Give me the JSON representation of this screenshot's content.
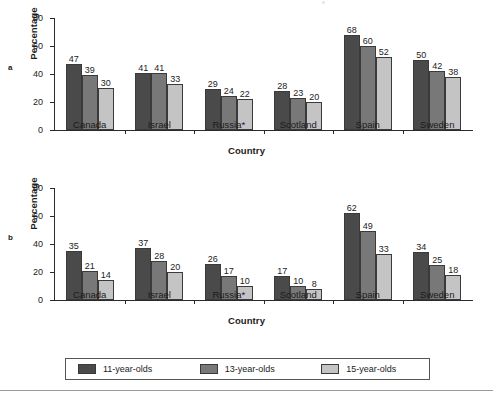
{
  "figure": {
    "bottom_rule": true
  },
  "panels": [
    {
      "tag": "a",
      "ylabel": "Percentage",
      "xlabel": "Country"
    },
    {
      "tag": "b",
      "ylabel": "Percentage",
      "xlabel": "Country"
    }
  ],
  "axis": {
    "yticks": [
      "0",
      "20",
      "40",
      "60",
      "80"
    ],
    "ymin": 0,
    "ymax": 80
  },
  "legend": {
    "items": [
      {
        "label": "11-year-olds",
        "swatch": "s0",
        "color": "#4a4a4a"
      },
      {
        "label": "13-year-olds",
        "swatch": "s1",
        "color": "#787878"
      },
      {
        "label": "15-year-olds",
        "swatch": "s2",
        "color": "#c4c4c4"
      }
    ]
  },
  "chart_data": [
    {
      "type": "bar",
      "panel": "a",
      "title": "",
      "xlabel": "Country",
      "ylabel": "Percentage",
      "ylim": [
        0,
        80
      ],
      "yticks": [
        0,
        20,
        40,
        60,
        80
      ],
      "grid": false,
      "legend_position": "bottom",
      "categories": [
        "Canada",
        "Israel",
        "Russia*",
        "Scotland",
        "Spain",
        "Sweden"
      ],
      "series": [
        {
          "name": "11-year-olds",
          "color": "#4a4a4a",
          "values": [
            47,
            41,
            29,
            28,
            68,
            50
          ]
        },
        {
          "name": "13-year-olds",
          "color": "#787878",
          "values": [
            39,
            41,
            24,
            23,
            60,
            42
          ]
        },
        {
          "name": "15-year-olds",
          "color": "#c4c4c4",
          "values": [
            30,
            33,
            22,
            20,
            52,
            38
          ]
        }
      ]
    },
    {
      "type": "bar",
      "panel": "b",
      "title": "",
      "xlabel": "Country",
      "ylabel": "Percentage",
      "ylim": [
        0,
        80
      ],
      "yticks": [
        0,
        20,
        40,
        60,
        80
      ],
      "grid": false,
      "legend_position": "bottom",
      "categories": [
        "Canada",
        "Israel",
        "Russia*",
        "Scotland",
        "Spain",
        "Sweden"
      ],
      "series": [
        {
          "name": "11-year-olds",
          "color": "#4a4a4a",
          "values": [
            35,
            37,
            26,
            17,
            62,
            34
          ]
        },
        {
          "name": "13-year-olds",
          "color": "#787878",
          "values": [
            21,
            28,
            17,
            10,
            49,
            25
          ]
        },
        {
          "name": "15-year-olds",
          "color": "#c4c4c4",
          "values": [
            14,
            20,
            10,
            8,
            33,
            18
          ]
        }
      ]
    }
  ]
}
